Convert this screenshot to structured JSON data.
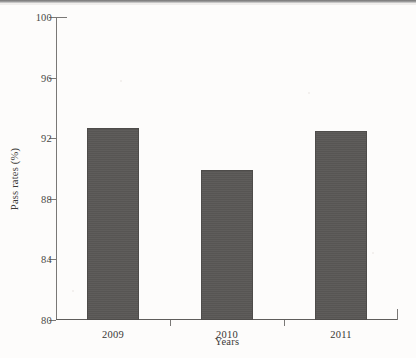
{
  "chart_data": {
    "type": "bar",
    "title": "",
    "categories": [
      "2009",
      "2010",
      "2011"
    ],
    "values": [
      92.7,
      89.9,
      92.5
    ],
    "series": [
      {
        "name": "Pass rates",
        "values": [
          92.7,
          89.9,
          92.5
        ]
      }
    ],
    "xlabel": "Years",
    "ylabel": "Pass rates (%)",
    "ylim": [
      80,
      100
    ],
    "yticks": [
      80,
      84,
      88,
      92,
      96,
      100
    ],
    "ytick_labels": [
      "80",
      "84",
      "88",
      "92",
      "96",
      "100"
    ],
    "grid": false,
    "legend": false,
    "legend_position": "none",
    "bar_color": "#595755",
    "axis_color": "#7a7876",
    "background_color": "#fdfcfb"
  }
}
